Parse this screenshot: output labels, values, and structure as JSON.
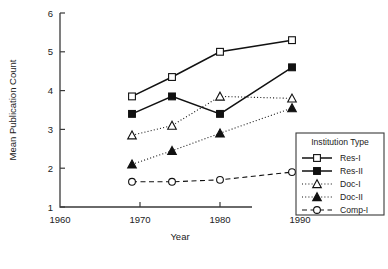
{
  "chart_data": {
    "type": "line",
    "title": "",
    "xlabel": "Year",
    "ylabel": "Mean Publication Count",
    "x": [
      1969,
      1974,
      1980,
      1989
    ],
    "xlim": [
      1960,
      1990
    ],
    "ylim": [
      1,
      6
    ],
    "xticks": [
      1960,
      1970,
      1980,
      1990
    ],
    "yticks": [
      1,
      2,
      3,
      4,
      5,
      6
    ],
    "grid": false,
    "legend_position": "right",
    "legend_title": "Institution Type",
    "series": [
      {
        "name": "Res-I",
        "values": [
          3.85,
          4.35,
          5.0,
          5.3
        ],
        "marker": "open-square",
        "line": "solid"
      },
      {
        "name": "Res-II",
        "values": [
          3.4,
          3.85,
          3.4,
          4.6
        ],
        "marker": "filled-square",
        "line": "solid"
      },
      {
        "name": "Doc-I",
        "values": [
          2.85,
          3.1,
          3.85,
          3.8
        ],
        "marker": "open-triangle",
        "line": "dotted"
      },
      {
        "name": "Doc-II",
        "values": [
          2.1,
          2.45,
          2.9,
          3.55
        ],
        "marker": "filled-triangle",
        "line": "dotted"
      },
      {
        "name": "Comp-I",
        "values": [
          1.65,
          1.65,
          1.7,
          1.9
        ],
        "marker": "open-circle",
        "line": "dashed"
      }
    ]
  },
  "axis": {
    "xlabel": "Year",
    "ylabel": "Mean Publication Count",
    "xticklabels": [
      "1960",
      "1970",
      "1980",
      "1990"
    ],
    "yticklabels": [
      "1",
      "2",
      "3",
      "4",
      "5",
      "6"
    ]
  },
  "legend": {
    "title": "Institution Type",
    "entries": [
      {
        "label": "Res-I"
      },
      {
        "label": "Res-II"
      },
      {
        "label": "Doc-I"
      },
      {
        "label": "Doc-II"
      },
      {
        "label": "Comp-I"
      }
    ]
  },
  "colors": {
    "ink": "#1a1a1a",
    "axis": "#3a3a3a",
    "background": "#ffffff"
  }
}
